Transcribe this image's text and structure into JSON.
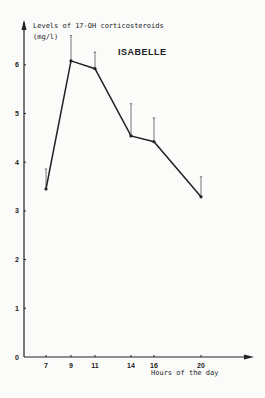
{
  "chart_data": {
    "type": "line",
    "title": "ISABELLE",
    "ylabel": "Levels of 17-OH corticosteroids",
    "ylabel_unit": "(mg/l)",
    "xlabel": "Hours of the day",
    "x": [
      7,
      9,
      11,
      14,
      16,
      20
    ],
    "x_tick_labels": [
      "7",
      "9",
      "11",
      "14",
      "16",
      "20"
    ],
    "y_tick_labels": [
      "0",
      "1",
      "2",
      "3",
      "4",
      "5",
      "6"
    ],
    "ylim": [
      0,
      7
    ],
    "grid": false,
    "legend": null,
    "series": [
      {
        "name": "ISABELLE",
        "values": [
          3.45,
          6.08,
          5.92,
          4.54,
          4.42,
          3.29
        ],
        "error_upper": [
          3.86,
          6.6,
          6.26,
          5.2,
          4.91,
          3.7
        ]
      }
    ],
    "color": "#222222"
  }
}
